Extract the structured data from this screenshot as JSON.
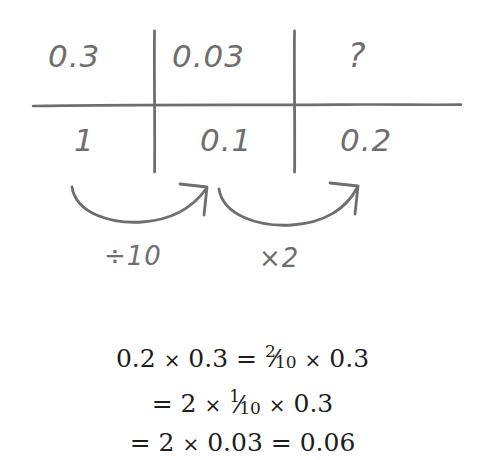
{
  "worksheet": {
    "title": "Decimal multiplication place-value table",
    "ink_color": "#6e6e6e",
    "text_color": "#1d1d20",
    "background": "#ffffff"
  },
  "table": {
    "columns": 3,
    "rows": 2,
    "top_row": [
      {
        "id": "r1c1",
        "value": "0.3"
      },
      {
        "id": "r1c2",
        "value": "0.03"
      },
      {
        "id": "r1c3",
        "value": "?"
      }
    ],
    "bottom_row": [
      {
        "id": "r2c1",
        "value": "1"
      },
      {
        "id": "r2c2",
        "value": "0.1"
      },
      {
        "id": "r2c3",
        "value": "0.2"
      }
    ]
  },
  "arrows": [
    {
      "id": "arrow-1",
      "label": "÷10",
      "from": "1",
      "to": "0.1"
    },
    {
      "id": "arrow-2",
      "label": "×2",
      "from": "0.1",
      "to": "0.2"
    }
  ],
  "equations": [
    {
      "id": "eq-line-1",
      "parts": {
        "lhs": "0.2",
        "times1": "×",
        "a": "0.3",
        "equals": "=",
        "frac_num": "2",
        "frac_slash": "⁄",
        "frac_den": "10",
        "times2": "×",
        "b": "0.3"
      },
      "plain": "0.2 × 0.3 = 2/10 × 0.3"
    },
    {
      "id": "eq-line-2",
      "parts": {
        "equals": "=",
        "lhs": "2",
        "times1": "×",
        "frac_num": "1",
        "frac_slash": "⁄",
        "frac_den": "10",
        "times2": "×",
        "b": "0.3"
      },
      "plain": "= 2 × 1/10 × 0.3"
    },
    {
      "id": "eq-line-3",
      "parts": {
        "equals1": "=",
        "lhs": "2",
        "times1": "×",
        "a": "0.03",
        "equals2": "=",
        "result": "0.06"
      },
      "plain": "= 2 × 0.03 = 0.06"
    }
  ]
}
